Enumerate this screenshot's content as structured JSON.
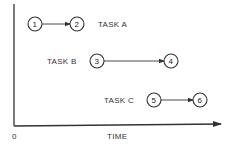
{
  "diagram": {
    "axis": {
      "origin_label": "0",
      "x_label": "TIME",
      "color": "#333333"
    },
    "tasks": [
      {
        "label": "TASK A",
        "start_node": "1",
        "end_node": "2"
      },
      {
        "label": "TASK B",
        "start_node": "3",
        "end_node": "4"
      },
      {
        "label": "TASK C",
        "start_node": "5",
        "end_node": "6"
      }
    ]
  }
}
